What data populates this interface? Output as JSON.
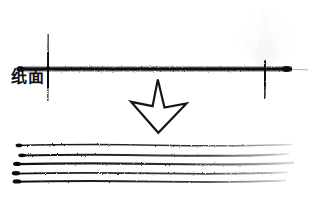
{
  "figure": {
    "background_color": "#ffffff",
    "ink_color": "#111111",
    "width": 316,
    "height": 201,
    "labels": {
      "paper_surface": "纸面"
    },
    "elements": {
      "paper_surface_line": {
        "name": "纸面",
        "y": 69,
        "x_start": 18,
        "x_end": 292,
        "texture": "grainy-ink"
      },
      "left_end_dot": {
        "x": 20,
        "y": 69,
        "rx": 4,
        "ry": 2.6
      },
      "right_end_dot": {
        "x": 287,
        "y": 69,
        "rx": 4.5,
        "ry": 3
      },
      "vertical_tick_left": {
        "x": 48,
        "y_top": 34,
        "y_bottom": 101
      },
      "vertical_tick_right": {
        "x": 265,
        "y_top": 60,
        "y_bottom": 99
      },
      "ink_splatter": {
        "origin_x": 265,
        "origin_y": 68,
        "spread_deg": 78,
        "max_length": 58,
        "ray_count": 70
      },
      "down_arrow": {
        "tip_x": 158,
        "tip_y": 133,
        "top_y": 79,
        "left_x": 131,
        "right_x": 186
      },
      "hatch_lines": [
        {
          "index": 1,
          "y": 145,
          "x_start": 17,
          "x_end": 292,
          "weight": 1.3
        },
        {
          "index": 2,
          "y": 155,
          "x_start": 20,
          "x_end": 289,
          "weight": 1.8
        },
        {
          "index": 3,
          "y": 164,
          "x_start": 15,
          "x_end": 294,
          "weight": 2.0
        },
        {
          "index": 4,
          "y": 173,
          "x_start": 14,
          "x_end": 288,
          "weight": 1.6
        },
        {
          "index": 5,
          "y": 181,
          "x_start": 15,
          "x_end": 286,
          "weight": 1.7
        }
      ]
    }
  }
}
